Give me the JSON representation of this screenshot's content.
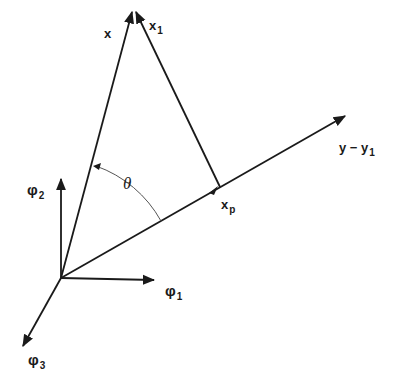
{
  "diagram": {
    "type": "vector-projection",
    "labels": {
      "x": {
        "main": "x",
        "sub": ""
      },
      "x1": {
        "main": "x",
        "sub": "1"
      },
      "y_minus_y1": {
        "main": "y − y",
        "sub": "1"
      },
      "xp": {
        "main": "x",
        "sub": "p"
      },
      "theta": {
        "main": "θ",
        "sub": ""
      },
      "phi1": {
        "main": "φ",
        "sub": "1"
      },
      "phi2": {
        "main": "φ",
        "sub": "2"
      },
      "phi3": {
        "main": "φ",
        "sub": "3"
      }
    },
    "colors": {
      "stroke": "#1a1a1a",
      "arc": "#555555",
      "background": "#ffffff"
    }
  }
}
